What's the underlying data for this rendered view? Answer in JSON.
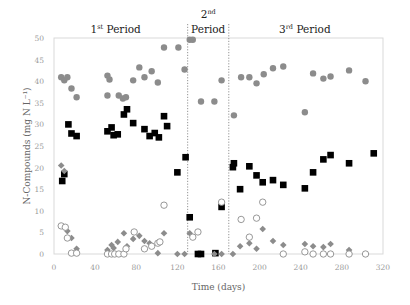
{
  "chart_data": {
    "type": "scatter",
    "title": "",
    "xlabel": "Time (days)",
    "ylabel": "N-Compounds (mg N L⁻¹)",
    "xlim": [
      0,
      320
    ],
    "ylim": [
      0,
      50
    ],
    "xticks": [
      0,
      40,
      80,
      120,
      160,
      200,
      240,
      280,
      320
    ],
    "yticks": [
      0,
      5,
      10,
      15,
      20,
      25,
      30,
      35,
      40,
      45,
      50
    ],
    "grid": false,
    "legend": null,
    "period_dividers": [
      130,
      170
    ],
    "period_labels": [
      {
        "text": "1",
        "sup": "st",
        "rest": " Period",
        "x": 60,
        "line": 1
      },
      {
        "text": "2",
        "sup": "nd",
        "rest": "",
        "x": 150,
        "line": 0
      },
      {
        "text": "",
        "sup": "",
        "rest": "Period",
        "x": 150,
        "line": 1
      },
      {
        "text": "3",
        "sup": "rd",
        "rest": " Period",
        "x": 244,
        "line": 1
      }
    ],
    "series": [
      {
        "name": "gray-filled-circles",
        "marker": "circle-filled",
        "color": "#8c8c8c",
        "points": [
          [
            7,
            40.9
          ],
          [
            10,
            40.2
          ],
          [
            13,
            40.9
          ],
          [
            17,
            38.3
          ],
          [
            22,
            36.3
          ],
          [
            52,
            41.3
          ],
          [
            54,
            40.4
          ],
          [
            52,
            36.7
          ],
          [
            63,
            36.7
          ],
          [
            67,
            36.0
          ],
          [
            70,
            36.3
          ],
          [
            77,
            40.2
          ],
          [
            83,
            43.2
          ],
          [
            88,
            40.9
          ],
          [
            95,
            42.3
          ],
          [
            101,
            39.7
          ],
          [
            107,
            47.8
          ],
          [
            121,
            47.8
          ],
          [
            127,
            42.7
          ],
          [
            132,
            49.6
          ],
          [
            135,
            49.6
          ],
          [
            143,
            35.3
          ],
          [
            156,
            35.3
          ],
          [
            163,
            40.2
          ],
          [
            175,
            32.1
          ],
          [
            182,
            40.9
          ],
          [
            190,
            40.9
          ],
          [
            197,
            39.5
          ],
          [
            204,
            41.6
          ],
          [
            213,
            43.0
          ],
          [
            223,
            43.4
          ],
          [
            244,
            32.8
          ],
          [
            252,
            41.8
          ],
          [
            262,
            40.6
          ],
          [
            269,
            41.1
          ],
          [
            287,
            42.5
          ],
          [
            303,
            40.0
          ]
        ]
      },
      {
        "name": "black-squares",
        "marker": "square-filled",
        "color": "#000000",
        "points": [
          [
            8,
            16.9
          ],
          [
            10,
            18.5
          ],
          [
            14,
            30.0
          ],
          [
            17,
            27.9
          ],
          [
            22,
            27.3
          ],
          [
            52,
            28.4
          ],
          [
            56,
            29.3
          ],
          [
            58,
            27.5
          ],
          [
            62,
            27.7
          ],
          [
            68,
            32.3
          ],
          [
            71,
            33.5
          ],
          [
            77,
            30.3
          ],
          [
            88,
            28.9
          ],
          [
            93,
            27.3
          ],
          [
            98,
            28.0
          ],
          [
            102,
            27.0
          ],
          [
            107,
            31.9
          ],
          [
            110,
            29.6
          ],
          [
            120,
            18.9
          ],
          [
            128,
            22.4
          ],
          [
            132,
            8.5
          ],
          [
            140,
            0.0
          ],
          [
            143,
            0.0
          ],
          [
            157,
            0.2
          ],
          [
            163,
            10.9
          ],
          [
            174,
            20.1
          ],
          [
            175,
            21.0
          ],
          [
            181,
            15.0
          ],
          [
            190,
            20.3
          ],
          [
            197,
            18.2
          ],
          [
            203,
            16.6
          ],
          [
            213,
            17.1
          ],
          [
            223,
            16.0
          ],
          [
            244,
            15.2
          ],
          [
            252,
            18.9
          ],
          [
            262,
            21.9
          ],
          [
            269,
            22.9
          ],
          [
            287,
            21.0
          ],
          [
            311,
            23.3
          ]
        ]
      },
      {
        "name": "gray-diamonds",
        "marker": "diamond-filled",
        "color": "#8c8c8c",
        "points": [
          [
            7,
            20.5
          ],
          [
            10,
            19.2
          ],
          [
            13,
            5.3
          ],
          [
            17,
            3.7
          ],
          [
            22,
            1.2
          ],
          [
            52,
            0.9
          ],
          [
            56,
            2.1
          ],
          [
            58,
            1.4
          ],
          [
            62,
            2.8
          ],
          [
            68,
            4.8
          ],
          [
            71,
            1.8
          ],
          [
            77,
            3.5
          ],
          [
            83,
            4.2
          ],
          [
            88,
            3.0
          ],
          [
            93,
            2.5
          ],
          [
            101,
            0.2
          ],
          [
            107,
            4.8
          ],
          [
            120,
            0.0
          ],
          [
            127,
            0.0
          ],
          [
            132,
            4.8
          ],
          [
            156,
            0.0
          ],
          [
            163,
            0.0
          ],
          [
            174,
            0.0
          ],
          [
            181,
            1.8
          ],
          [
            190,
            2.5
          ],
          [
            197,
            1.2
          ],
          [
            203,
            5.8
          ],
          [
            213,
            3.0
          ],
          [
            223,
            2.1
          ],
          [
            244,
            2.3
          ],
          [
            252,
            1.8
          ],
          [
            262,
            1.6
          ],
          [
            269,
            2.3
          ],
          [
            287,
            0.9
          ],
          [
            303,
            0.0
          ]
        ]
      },
      {
        "name": "open-circles",
        "marker": "circle-open",
        "color": "#8c8c8c",
        "points": [
          [
            7,
            6.5
          ],
          [
            11,
            6.2
          ],
          [
            13,
            3.7
          ],
          [
            17,
            0.2
          ],
          [
            22,
            0.2
          ],
          [
            52,
            0.0
          ],
          [
            56,
            0.0
          ],
          [
            59,
            0.0
          ],
          [
            63,
            0.0
          ],
          [
            68,
            0.0
          ],
          [
            70,
            1.2
          ],
          [
            78,
            5.1
          ],
          [
            88,
            1.2
          ],
          [
            95,
            1.8
          ],
          [
            101,
            2.5
          ],
          [
            103,
            2.8
          ],
          [
            107,
            11.3
          ],
          [
            135,
            3.9
          ],
          [
            140,
            5.1
          ],
          [
            163,
            12.0
          ],
          [
            182,
            8.0
          ],
          [
            190,
            3.9
          ],
          [
            197,
            8.3
          ],
          [
            203,
            12.0
          ],
          [
            223,
            0.0
          ],
          [
            244,
            0.5
          ],
          [
            252,
            0.0
          ],
          [
            262,
            0.0
          ],
          [
            269,
            0.0
          ],
          [
            287,
            0.0
          ],
          [
            303,
            0.0
          ]
        ]
      }
    ]
  }
}
